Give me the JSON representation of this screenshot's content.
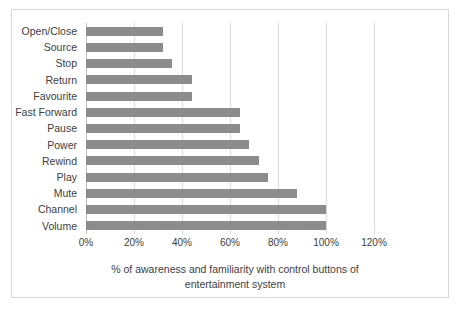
{
  "chart_data": {
    "type": "bar",
    "orientation": "horizontal",
    "title": "",
    "xlabel": "% of awareness and familiarity with control buttons of entertainment system",
    "ylabel": "",
    "categories": [
      "Open/Close",
      "Source",
      "Stop",
      "Return",
      "Favourite",
      "Fast Forward",
      "Pause",
      "Power",
      "Rewind",
      "Play",
      "Mute",
      "Channel",
      "Volume"
    ],
    "values": [
      32,
      32,
      36,
      44,
      44,
      64,
      64,
      68,
      72,
      76,
      88,
      100,
      100
    ],
    "xlim": [
      0,
      120
    ],
    "xticks": [
      0,
      20,
      40,
      60,
      80,
      100,
      120
    ],
    "xtick_labels": [
      "0%",
      "20%",
      "40%",
      "60%",
      "80%",
      "100%",
      "120%"
    ],
    "grid": "vertical",
    "legend": false,
    "bar_color": "#8c8c8c",
    "gridline_color": "#d9d9d9",
    "border_color": "#d9d9d9"
  },
  "axis_title": {
    "line1": "% of awareness and familiarity with control buttons of",
    "line2": "entertainment system"
  }
}
